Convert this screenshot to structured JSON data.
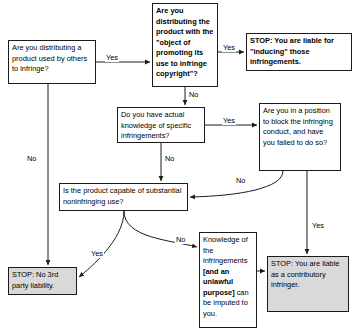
{
  "diagram": {
    "nodes": {
      "distributing": "Are you distributing a product used by others to infringe?",
      "object": "Are you distributing the product with the \"object of promoting its use to infringe copyright\"?",
      "inducing": "STOP: You are liable for \"inducing\" those infringements.",
      "actual_knowledge": "Do you have actual knowledge of specific infringements?",
      "block": "Are you in a position to block the infringing conduct, and have you failed to do so?",
      "substantial": "Is the product capable of substantial noninfringing use?",
      "no_liability": "STOP: No 3rd party liability.",
      "knowledge_imputed_a": "Knowledge of the infringements ",
      "knowledge_imputed_b": "[and an unlawful purpose]",
      "knowledge_imputed_c": " can be imputed to you.",
      "contributory": "STOP: You are liable as a contributory infringer."
    },
    "edge_labels": {
      "distributing_yes": "Yes",
      "distributing_no": "No",
      "object_yes": "Yes",
      "object_no": "No",
      "actual_yes": "Yes",
      "actual_no": "No",
      "block_no": "No",
      "block_yes": "Yes",
      "substantial_yes": "Yes",
      "substantial_no": "No"
    },
    "colors": {
      "line": "#1b1b1b",
      "stop_fill": "#d9d9d9",
      "node_fill": "#ffffff",
      "text": "#000000"
    }
  }
}
